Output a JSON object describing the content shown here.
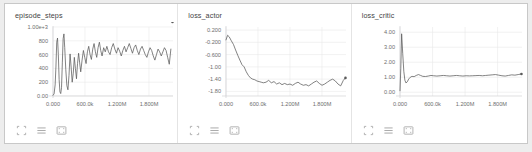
{
  "panel": {
    "background_color": "#ededed",
    "card_background": "#ffffff",
    "line_color": "#5a5a5a",
    "grid_color": "#e9e9ea"
  },
  "toolbar": {
    "icons": [
      {
        "name": "expand-corners-icon",
        "label": "Fit domain to data"
      },
      {
        "name": "hamburger-lines-icon",
        "label": "Toggle smoothing / lines"
      },
      {
        "name": "crop-frame-icon",
        "label": "Toggle fullscreen"
      }
    ]
  },
  "charts": [
    {
      "title": "episode_steps",
      "xticks": [
        "0.000",
        "600.0k",
        "1.200M",
        "1.800M"
      ],
      "yticks": [
        "1.00e+3",
        "800",
        "600",
        "400",
        "200",
        "0.00"
      ]
    },
    {
      "title": "loss_actor",
      "xticks": [
        "0.000",
        "600.0k",
        "1.200M",
        "1.800M"
      ],
      "yticks": [
        "0.200",
        "-0.200",
        "-0.600",
        "-1.00",
        "-1.40",
        "-1.80"
      ]
    },
    {
      "title": "loss_critic",
      "xticks": [
        "0.000",
        "600.0k",
        "1.200M",
        "1.800M"
      ],
      "yticks": [
        "4.00",
        "3.00",
        "2.00",
        "1.00",
        "0.00"
      ]
    }
  ],
  "chart_data": [
    {
      "type": "line",
      "title": "episode_steps",
      "xlabel": "",
      "ylabel": "",
      "xlim": [
        0,
        2250000
      ],
      "ylim": [
        0,
        1000
      ],
      "xtick_values": [
        0,
        600000,
        1200000,
        1800000
      ],
      "xtick_labels": [
        "0.000",
        "600.0k",
        "1.200M",
        "1.800M"
      ],
      "ytick_values": [
        1000,
        800,
        600,
        400,
        200,
        0
      ],
      "ytick_labels": [
        "1.00e+3",
        "800",
        "600",
        "400",
        "200",
        "0.00"
      ],
      "grid": true,
      "legend": "none",
      "series": [
        {
          "name": "episode_steps",
          "x": [
            0,
            20000,
            40000,
            55000,
            70000,
            85000,
            100000,
            115000,
            130000,
            145000,
            160000,
            175000,
            190000,
            205000,
            220000,
            240000,
            260000,
            280000,
            300000,
            320000,
            340000,
            360000,
            380000,
            400000,
            420000,
            440000,
            460000,
            480000,
            500000,
            520000,
            545000,
            570000,
            595000,
            620000,
            645000,
            670000,
            695000,
            720000,
            745000,
            770000,
            795000,
            820000,
            845000,
            870000,
            895000,
            920000,
            950000,
            980000,
            1010000,
            1040000,
            1070000,
            1100000,
            1130000,
            1160000,
            1190000,
            1220000,
            1250000,
            1280000,
            1310000,
            1340000,
            1370000,
            1400000,
            1430000,
            1460000,
            1490000,
            1520000,
            1550000,
            1580000,
            1610000,
            1640000,
            1670000,
            1700000,
            1730000,
            1760000,
            1790000,
            1820000,
            1850000,
            1880000,
            1910000,
            1940000,
            1970000,
            2000000,
            2030000,
            2060000,
            2090000,
            2120000,
            2150000,
            2180000,
            2210000,
            2240000
          ],
          "y": [
            10,
            30,
            160,
            420,
            780,
            840,
            600,
            240,
            60,
            35,
            120,
            480,
            830,
            900,
            700,
            380,
            150,
            90,
            300,
            610,
            420,
            200,
            330,
            560,
            400,
            250,
            470,
            620,
            480,
            350,
            520,
            660,
            560,
            470,
            640,
            720,
            600,
            530,
            680,
            760,
            640,
            560,
            700,
            780,
            660,
            580,
            700,
            640,
            720,
            640,
            600,
            700,
            760,
            680,
            620,
            700,
            650,
            580,
            660,
            720,
            640,
            700,
            760,
            690,
            620,
            700,
            740,
            660,
            600,
            680,
            720,
            660,
            600,
            560,
            640,
            700,
            660,
            580,
            520,
            600,
            680,
            640,
            580,
            640,
            700,
            660,
            560,
            460,
            680
          ],
          "color": "#5a5a5a"
        }
      ]
    },
    {
      "type": "line",
      "title": "loss_actor",
      "xlabel": "",
      "ylabel": "",
      "xlim": [
        0,
        2250000
      ],
      "ylim": [
        -1.95,
        0.3
      ],
      "xtick_values": [
        0,
        600000,
        1200000,
        1800000
      ],
      "xtick_labels": [
        "0.000",
        "600.0k",
        "1.200M",
        "1.800M"
      ],
      "ytick_values": [
        0.2,
        -0.2,
        -0.6,
        -1.0,
        -1.4,
        -1.8
      ],
      "ytick_labels": [
        "0.200",
        "-0.200",
        "-0.600",
        "-1.00",
        "-1.40",
        "-1.80"
      ],
      "grid": true,
      "legend": "none",
      "series": [
        {
          "name": "loss_actor",
          "x": [
            0,
            30000,
            60000,
            100000,
            140000,
            180000,
            220000,
            260000,
            300000,
            340000,
            380000,
            420000,
            460000,
            500000,
            540000,
            580000,
            620000,
            660000,
            700000,
            750000,
            800000,
            850000,
            900000,
            950000,
            1000000,
            1050000,
            1100000,
            1150000,
            1200000,
            1250000,
            1300000,
            1350000,
            1400000,
            1450000,
            1500000,
            1550000,
            1600000,
            1650000,
            1700000,
            1750000,
            1800000,
            1850000,
            1900000,
            1950000,
            2000000,
            2050000,
            2100000,
            2150000,
            2200000,
            2240000
          ],
          "y": [
            -0.12,
            0.03,
            -0.02,
            -0.15,
            -0.27,
            -0.45,
            -0.62,
            -0.78,
            -0.93,
            -1.0,
            -1.16,
            -1.28,
            -1.36,
            -1.4,
            -1.42,
            -1.46,
            -1.48,
            -1.5,
            -1.52,
            -1.5,
            -1.44,
            -1.52,
            -1.48,
            -1.56,
            -1.52,
            -1.58,
            -1.54,
            -1.58,
            -1.56,
            -1.6,
            -1.54,
            -1.5,
            -1.56,
            -1.6,
            -1.58,
            -1.62,
            -1.56,
            -1.5,
            -1.46,
            -1.54,
            -1.6,
            -1.56,
            -1.5,
            -1.44,
            -1.4,
            -1.46,
            -1.56,
            -1.62,
            -1.44,
            -1.36
          ],
          "color": "#5a5a5a"
        }
      ]
    },
    {
      "type": "line",
      "title": "loss_critic",
      "xlabel": "",
      "ylabel": "",
      "xlim": [
        0,
        2250000
      ],
      "ylim": [
        -0.25,
        4.35
      ],
      "xtick_values": [
        0,
        600000,
        1200000,
        1800000
      ],
      "xtick_labels": [
        "0.000",
        "600.0k",
        "1.200M",
        "1.800M"
      ],
      "ytick_values": [
        4.0,
        3.0,
        2.0,
        1.0,
        0.0
      ],
      "ytick_labels": [
        "4.00",
        "3.00",
        "2.00",
        "1.00",
        "0.00"
      ],
      "grid": true,
      "legend": "none",
      "series": [
        {
          "name": "loss_critic",
          "x": [
            0,
            15000,
            30000,
            50000,
            70000,
            90000,
            110000,
            135000,
            160000,
            190000,
            220000,
            260000,
            300000,
            340000,
            380000,
            420000,
            470000,
            520000,
            570000,
            620000,
            680000,
            740000,
            800000,
            860000,
            920000,
            980000,
            1040000,
            1100000,
            1160000,
            1220000,
            1280000,
            1340000,
            1400000,
            1460000,
            1520000,
            1580000,
            1640000,
            1700000,
            1760000,
            1820000,
            1880000,
            1940000,
            2000000,
            2060000,
            2120000,
            2180000,
            2240000
          ],
          "y": [
            0.1,
            1.6,
            3.9,
            2.6,
            1.4,
            0.8,
            0.62,
            0.7,
            0.88,
            1.0,
            1.06,
            1.04,
            1.12,
            1.18,
            1.12,
            1.06,
            1.05,
            1.08,
            1.12,
            1.1,
            1.08,
            1.1,
            1.12,
            1.1,
            1.08,
            1.1,
            1.12,
            1.1,
            1.08,
            1.1,
            1.09,
            1.1,
            1.11,
            1.12,
            1.1,
            1.12,
            1.14,
            1.16,
            1.18,
            1.14,
            1.1,
            1.08,
            1.12,
            1.16,
            1.14,
            1.18,
            1.22
          ],
          "color": "#5a5a5a"
        }
      ]
    }
  ]
}
